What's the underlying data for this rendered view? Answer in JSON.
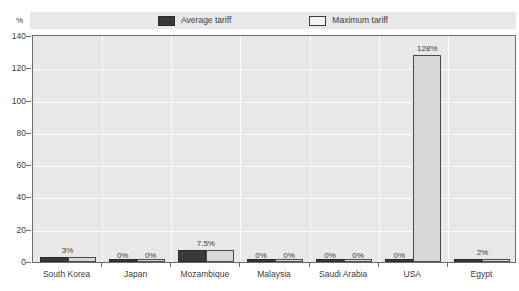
{
  "chart_data": {
    "type": "bar",
    "title": "",
    "subtitle": "",
    "xlabel": "",
    "ylabel": "%",
    "unit_label": "%",
    "ylim": [
      0,
      140
    ],
    "ytick_step": 20,
    "yticks": [
      "0",
      "20",
      "40",
      "60",
      "80",
      "100",
      "120",
      "140"
    ],
    "grid": true,
    "legend_position": "top-center",
    "categories": [
      "South Korea",
      "Japan",
      "Mozambique",
      "Malaysia",
      "Saudi Arabia",
      "USA",
      "Egypt"
    ],
    "series": [
      {
        "name": "Average tariff",
        "color": "#3a3a3a",
        "values": [
          3,
          0,
          7.5,
          0,
          0,
          0,
          2
        ]
      },
      {
        "name": "Maximum tariff",
        "color": "#d8d8d8",
        "values": [
          3,
          0,
          7.5,
          0,
          0,
          128,
          2
        ]
      }
    ],
    "value_labels": [
      {
        "category": "South Korea",
        "text": "3%",
        "mode": "shared"
      },
      {
        "category": "Japan",
        "text": "0%",
        "mode": "pair-left"
      },
      {
        "category": "Japan",
        "text": "0%",
        "mode": "pair-right"
      },
      {
        "category": "Mozambique",
        "text": "7.5%",
        "mode": "shared"
      },
      {
        "category": "Malaysia",
        "text": "0%",
        "mode": "pair-left"
      },
      {
        "category": "Malaysia",
        "text": "0%",
        "mode": "pair-right"
      },
      {
        "category": "Saudi Arabia",
        "text": "0%",
        "mode": "pair-left"
      },
      {
        "category": "Saudi Arabia",
        "text": "0%",
        "mode": "pair-right"
      },
      {
        "category": "USA",
        "text": "0%",
        "mode": "pair-left"
      },
      {
        "category": "USA",
        "text": "128%",
        "mode": "above-max"
      },
      {
        "category": "Egypt",
        "text": "2%",
        "mode": "shared"
      }
    ]
  },
  "legend": {
    "items": [
      {
        "label": "Average tariff",
        "swatch": "filled-dark-swatch"
      },
      {
        "label": "Maximum tariff",
        "swatch": "outlined-light-swatch"
      }
    ]
  },
  "axis": {
    "unit": "%",
    "y_labels": [
      "140",
      "120",
      "100",
      "80",
      "60",
      "40",
      "20",
      "0"
    ],
    "x_labels": [
      "South Korea",
      "Japan",
      "Mozambique",
      "Malaysia",
      "Saudi Arabia",
      "USA",
      "Egypt"
    ]
  },
  "colors": {
    "plot_background": "#e8e8e8",
    "legend_background": "#e8e8e8",
    "average_bar": "#3a3a3a",
    "maximum_bar": "#d8d8d8",
    "axis_line": "#6e6e6e",
    "gridline": "#ffffff",
    "text": "#3c3c3c"
  }
}
